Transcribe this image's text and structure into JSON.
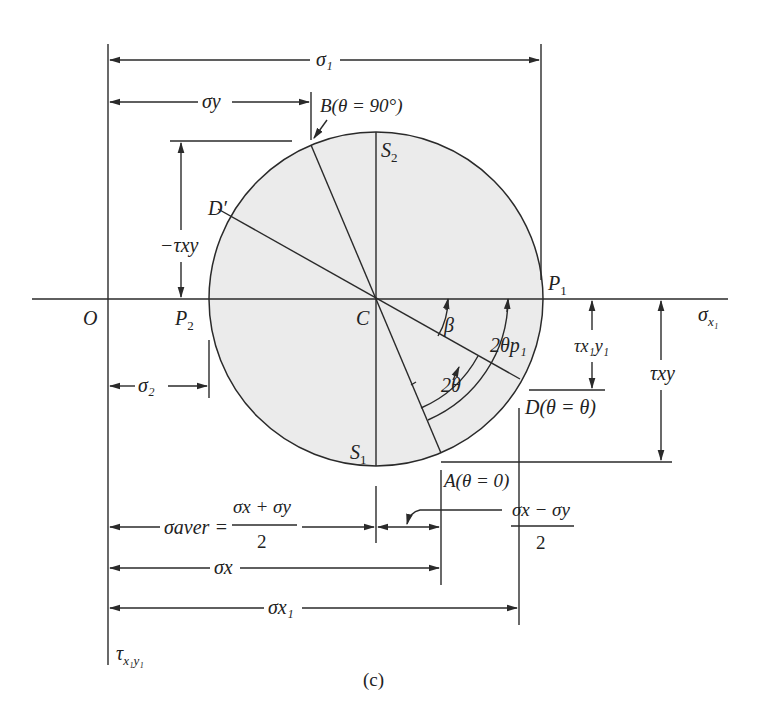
{
  "figure": {
    "caption": "(c)",
    "fill_color": "#ebebeb",
    "line_color": "#2a2a2a"
  },
  "points": {
    "origin": "O",
    "center": "C",
    "p1": "P",
    "p1_sub": "1",
    "p2": "P",
    "p2_sub": "2",
    "s1": "S",
    "s1_sub": "1",
    "s2": "S",
    "s2_sub": "2",
    "d_prime": "D′",
    "a_label": "A(θ = 0)",
    "b_label": "B(θ = 90°)",
    "d_label": "D(θ = θ)"
  },
  "axes": {
    "horizontal": "σ",
    "horizontal_sub": "x₁",
    "vertical": "τ",
    "vertical_sub": "x₁y₁"
  },
  "dimensions": {
    "sigma_1": "σ₁",
    "sigma_y": "σy",
    "sigma_2": "σ₂",
    "neg_tau_xy": "−τxy",
    "tau_x1y1": "τx₁y₁",
    "tau_xy": "τxy",
    "sigma_aver_lhs": "σaver =",
    "sigma_aver_num": "σx + σy",
    "sigma_aver_den": "2",
    "half_diff_num": "σx − σy",
    "half_diff_den": "2",
    "sigma_x": "σx",
    "sigma_x1": "σx₁"
  },
  "angles": {
    "beta": "β",
    "two_theta": "2θ",
    "two_theta_p1": "2θp₁"
  }
}
